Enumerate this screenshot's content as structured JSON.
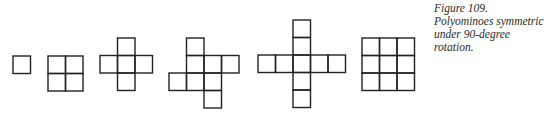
{
  "caption": {
    "line1": "Figure 109. Polyominoes symmetric",
    "line2": "under 90-degree rotation."
  },
  "figure": {
    "cell_size": 17.5,
    "stroke_color": "#222222",
    "stroke_width": 1.4,
    "polyominoes": [
      {
        "name": "monomino",
        "origin": [
          13,
          56
        ],
        "cells": [
          [
            0,
            0
          ]
        ]
      },
      {
        "name": "square-tetromino",
        "origin": [
          48,
          56
        ],
        "cells": [
          [
            0,
            0
          ],
          [
            1,
            0
          ],
          [
            0,
            1
          ],
          [
            1,
            1
          ]
        ]
      },
      {
        "name": "plus-pentomino",
        "origin": [
          100,
          38
        ],
        "cells": [
          [
            1,
            0
          ],
          [
            0,
            1
          ],
          [
            1,
            1
          ],
          [
            2,
            1
          ],
          [
            1,
            2
          ]
        ]
      },
      {
        "name": "pinwheel-octomino",
        "origin": [
          169,
          38
        ],
        "cells": [
          [
            1,
            0
          ],
          [
            1,
            1
          ],
          [
            2,
            1
          ],
          [
            3,
            1
          ],
          [
            0,
            2
          ],
          [
            1,
            2
          ],
          [
            2,
            2
          ],
          [
            2,
            3
          ]
        ]
      },
      {
        "name": "long-cross",
        "origin": [
          258,
          20
        ],
        "cells": [
          [
            2,
            0
          ],
          [
            2,
            1
          ],
          [
            0,
            2
          ],
          [
            1,
            2
          ],
          [
            2,
            2
          ],
          [
            3,
            2
          ],
          [
            4,
            2
          ],
          [
            2,
            3
          ],
          [
            2,
            4
          ]
        ]
      },
      {
        "name": "square-nonomino",
        "origin": [
          362,
          38
        ],
        "cells": [
          [
            0,
            0
          ],
          [
            1,
            0
          ],
          [
            2,
            0
          ],
          [
            0,
            1
          ],
          [
            1,
            1
          ],
          [
            2,
            1
          ],
          [
            0,
            2
          ],
          [
            1,
            2
          ],
          [
            2,
            2
          ]
        ]
      }
    ]
  }
}
